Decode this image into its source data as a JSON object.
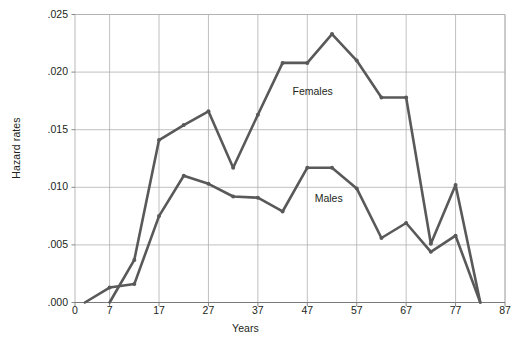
{
  "chart_data": {
    "type": "line",
    "title": "",
    "xlabel": "Years",
    "ylabel": "Hazard rates",
    "xlim": [
      0,
      87
    ],
    "ylim": [
      0.0,
      0.025
    ],
    "grid": true,
    "legend_position": "inline-annotations",
    "xticks": [
      "0",
      "7",
      "17",
      "27",
      "37",
      "47",
      "57",
      "67",
      "77",
      "87"
    ],
    "xtick_values": [
      0,
      7,
      17,
      27,
      37,
      47,
      57,
      67,
      77,
      87
    ],
    "yticks": [
      ".000",
      ".005",
      ".010",
      ".015",
      ".020",
      ".025"
    ],
    "ytick_values": [
      0.0,
      0.005,
      0.01,
      0.015,
      0.02,
      0.025
    ],
    "series": [
      {
        "name": "Females",
        "color": "#595959",
        "annotation": "Females",
        "x": [
          7,
          12,
          17,
          22,
          27,
          32,
          37,
          42,
          47,
          52,
          57,
          62,
          67,
          72,
          77,
          82
        ],
        "values": [
          0.0,
          0.0037,
          0.0141,
          0.0154,
          0.0166,
          0.0117,
          0.0163,
          0.0208,
          0.0208,
          0.0233,
          0.021,
          0.0178,
          0.0178,
          0.0051,
          0.0102,
          0.0
        ]
      },
      {
        "name": "Males",
        "color": "#595959",
        "annotation": "Males",
        "x": [
          2,
          7,
          12,
          17,
          22,
          27,
          32,
          37,
          42,
          47,
          52,
          57,
          62,
          67,
          72,
          77,
          82
        ],
        "values": [
          0.0,
          0.0013,
          0.0016,
          0.0075,
          0.011,
          0.0103,
          0.0092,
          0.0091,
          0.0079,
          0.0117,
          0.0117,
          0.0099,
          0.0056,
          0.0069,
          0.0044,
          0.0058,
          0.0
        ]
      }
    ],
    "annotations": [
      {
        "text": "Females",
        "x": 44.0,
        "y": 0.0183
      },
      {
        "text": "Males",
        "x": 48.5,
        "y": 0.009
      }
    ],
    "colors": {
      "line": "#595959",
      "grid": "#b0b0b0",
      "axis": "#7a7a7a",
      "text": "#231f20",
      "background": "#ffffff"
    }
  }
}
